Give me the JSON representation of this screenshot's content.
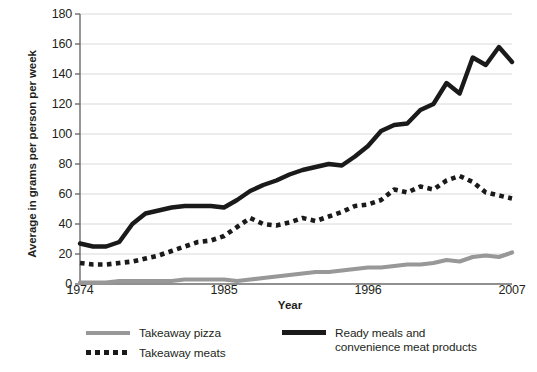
{
  "chart_data": {
    "type": "line",
    "title": "",
    "xlabel": "Year",
    "ylabel": "Average in grams per person per week",
    "xlim": [
      1974,
      2007
    ],
    "ylim": [
      0,
      180
    ],
    "grid": true,
    "legend_position": "bottom",
    "y_ticks": [
      180,
      160,
      140,
      120,
      100,
      80,
      60,
      40,
      20,
      0
    ],
    "x_ticks": [
      1974,
      1985,
      1996,
      2007
    ],
    "x": [
      1974,
      1975,
      1976,
      1977,
      1978,
      1979,
      1980,
      1981,
      1982,
      1983,
      1984,
      1985,
      1986,
      1987,
      1988,
      1989,
      1990,
      1991,
      1992,
      1993,
      1994,
      1995,
      1996,
      1997,
      1998,
      1999,
      2000,
      2001,
      2002,
      2003,
      2004,
      2005,
      2006,
      2007
    ],
    "series": [
      {
        "name": "Takeaway pizza",
        "style": "solid",
        "color": "#989898",
        "values": [
          1,
          1,
          1,
          2,
          2,
          2,
          2,
          2,
          3,
          3,
          3,
          3,
          2,
          3,
          4,
          5,
          6,
          7,
          8,
          8,
          9,
          10,
          11,
          11,
          12,
          13,
          13,
          14,
          16,
          15,
          18,
          19,
          18,
          21
        ]
      },
      {
        "name": "Takeaway meats",
        "style": "dotted",
        "color": "#1a1a1a",
        "values": [
          14,
          13,
          13,
          14,
          15,
          17,
          19,
          22,
          25,
          28,
          29,
          32,
          38,
          44,
          40,
          39,
          41,
          44,
          42,
          45,
          48,
          52,
          53,
          56,
          63,
          61,
          65,
          63,
          69,
          72,
          68,
          61,
          59,
          57
        ]
      },
      {
        "name": "Ready meals and convenience meat products",
        "style": "solid",
        "color": "#1a1a1a",
        "values": [
          27,
          25,
          25,
          28,
          40,
          47,
          49,
          51,
          52,
          52,
          52,
          51,
          56,
          62,
          66,
          69,
          73,
          76,
          78,
          80,
          79,
          85,
          92,
          102,
          106,
          107,
          116,
          120,
          134,
          127,
          151,
          146,
          158,
          148
        ]
      }
    ]
  },
  "axes": {
    "y_title": "Average in grams per person per week",
    "x_title": "Year",
    "y_tick_labels": [
      "180",
      "160",
      "140",
      "120",
      "100",
      "80",
      "60",
      "40",
      "20",
      "0"
    ],
    "x_tick_labels": [
      "1974",
      "1985",
      "1996",
      "2007"
    ]
  },
  "legend": {
    "items": [
      {
        "label": "Takeaway pizza",
        "marker": "solid-gray-line"
      },
      {
        "label": "Takeaway meats",
        "marker": "dotted-black-line"
      },
      {
        "label": "Ready meals and\nconvenience meat products",
        "marker": "solid-black-line"
      }
    ]
  },
  "colors": {
    "pizza": "#989898",
    "meats": "#1a1a1a",
    "ready_meals": "#1a1a1a",
    "grid": "#d9d9d9",
    "axis": "#6b6b6b",
    "text": "#231f20"
  }
}
